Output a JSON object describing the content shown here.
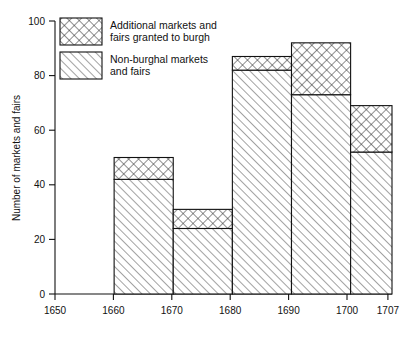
{
  "chart_data": {
    "type": "bar",
    "title": "",
    "subtitle": "",
    "xlabel": "",
    "ylabel": "Number of markets and fairs",
    "stacked": true,
    "orientation": "vertical",
    "grid": false,
    "legend_position": "top-left-inside",
    "xlim": [
      1650,
      1707
    ],
    "ylim": [
      0,
      100
    ],
    "x_tick_labels": [
      "1650",
      "1660",
      "1670",
      "1680",
      "1690",
      "1700",
      "1707"
    ],
    "x_tick_values": [
      1650,
      1660,
      1670,
      1680,
      1690,
      1700,
      1707
    ],
    "y_tick_labels": [
      "0",
      "20",
      "40",
      "60",
      "80",
      "100"
    ],
    "y_tick_values": [
      0,
      20,
      40,
      60,
      80,
      100
    ],
    "categories": [
      "1660-1670",
      "1670-1680",
      "1680-1690",
      "1690-1700",
      "1700-1707"
    ],
    "bin_edges": [
      [
        1660,
        1670
      ],
      [
        1670,
        1680
      ],
      [
        1680,
        1690
      ],
      [
        1690,
        1700
      ],
      [
        1700,
        1707
      ]
    ],
    "series": [
      {
        "name": "Non-burghal markets and fairs",
        "pattern": "diagonal-hatch",
        "values": [
          42,
          24,
          82,
          73,
          52
        ]
      },
      {
        "name": "Additional markets and fairs granted to burgh",
        "pattern": "cross-hatch",
        "values": [
          8,
          7,
          5,
          19,
          17
        ]
      }
    ],
    "totals": [
      50,
      31,
      87,
      92,
      69
    ]
  },
  "legend": {
    "items": [
      {
        "swatch": "cross-hatch-swatch",
        "line1": "Additional markets and",
        "line2": "fairs granted to burgh"
      },
      {
        "swatch": "diagonal-hatch-swatch",
        "line1": "Non-burghal markets",
        "line2": "and fairs"
      }
    ]
  },
  "colors": {
    "ink": "#111111",
    "background": "#ffffff"
  }
}
